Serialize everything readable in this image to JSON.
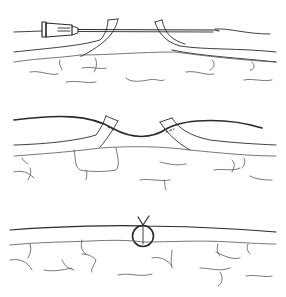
{
  "figure": {
    "panels": [
      {
        "id": "stage-1",
        "description": "needle passing through both skin edges of wound",
        "elements": [
          "needle-hub",
          "needle-shaft",
          "left-skin-flap",
          "right-skin-flap",
          "subcutaneous-tissue"
        ]
      },
      {
        "id": "stage-2",
        "description": "suture thread pulled through both skin edges, edges approximated",
        "elements": [
          "suture-thread",
          "left-skin-edge",
          "right-skin-edge",
          "subcutaneous-tissue"
        ]
      },
      {
        "id": "stage-3",
        "description": "wound closed with tied suture knot",
        "elements": [
          "suture-loop",
          "knot",
          "skin-surface",
          "subcutaneous-tissue"
        ]
      }
    ],
    "colors": {
      "line": "#2a2a2a",
      "tissue": "#555555",
      "background": "#ffffff"
    }
  }
}
